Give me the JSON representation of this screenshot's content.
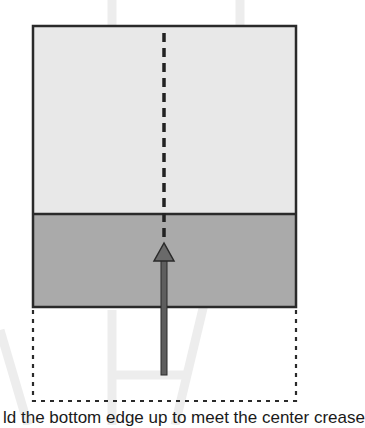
{
  "diagram": {
    "type": "folding-instruction",
    "caption": "ld the bottom edge up to meet the center crease",
    "colors": {
      "paper_light": "#e8e8e8",
      "paper_dark": "#aaaaaa",
      "outline": "#2a2a2a",
      "arrow": "#6a6a6a",
      "watermark": "#ececec"
    },
    "elements": [
      {
        "id": "paper-top",
        "label": "unfolded paper (light side)"
      },
      {
        "id": "paper-folded-flap",
        "label": "folded flap (dark side)"
      },
      {
        "id": "center-crease",
        "label": "dashed center crease line"
      },
      {
        "id": "fold-arrow",
        "label": "arrow showing fold upward"
      },
      {
        "id": "original-position",
        "label": "dotted outline of original bottom edge"
      }
    ]
  }
}
